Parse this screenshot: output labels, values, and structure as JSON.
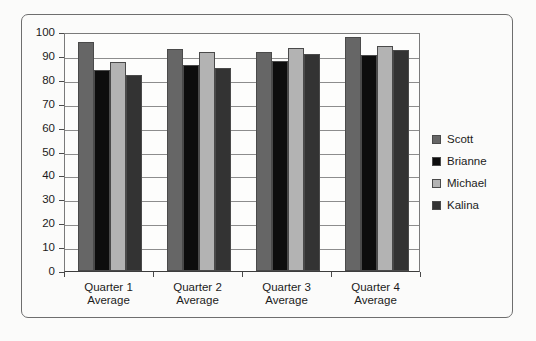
{
  "chart_data": {
    "type": "bar",
    "title": "",
    "subtitle": "",
    "xlabel": "",
    "ylabel": "",
    "categories": [
      "Quarter 1 Average",
      "Quarter 2 Average",
      "Quarter 3 Average",
      "Quarter 4 Average"
    ],
    "category_lines": [
      [
        "Quarter 1",
        "Average"
      ],
      [
        "Quarter 2",
        "Average"
      ],
      [
        "Quarter 3",
        "Average"
      ],
      [
        "Quarter 4",
        "Average"
      ]
    ],
    "series": [
      {
        "name": "Scott",
        "color": "#666666",
        "values": [
          96,
          93,
          91.5,
          98
        ]
      },
      {
        "name": "Brianne",
        "color": "#0d0d0d",
        "values": [
          84,
          86,
          88,
          90.5
        ]
      },
      {
        "name": "Michael",
        "color": "#b3b3b3",
        "values": [
          87.5,
          91.5,
          93.5,
          94
        ]
      },
      {
        "name": "Kalina",
        "color": "#333333",
        "values": [
          82,
          85,
          91,
          92.5
        ]
      }
    ],
    "ylim": [
      0,
      100
    ],
    "ytick_values": [
      0,
      10,
      20,
      30,
      40,
      50,
      60,
      70,
      80,
      90,
      100
    ],
    "ytick_labels": [
      "0",
      "10",
      "20",
      "30",
      "40",
      "50",
      "60",
      "70",
      "80",
      "90",
      "100"
    ],
    "grid": true,
    "grid_axis": "y",
    "legend_position": "right",
    "legend_entries": [
      "Scott",
      "Brianne",
      "Michael",
      "Kalina"
    ],
    "plot_background": "#fdfdfc",
    "frame_color": "#6e6e6e",
    "axis_color": "#4a4a4a"
  }
}
